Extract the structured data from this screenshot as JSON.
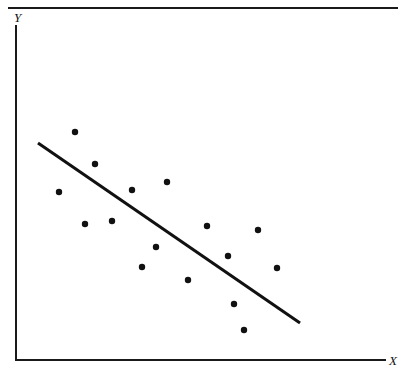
{
  "figure": {
    "background_color": "#ffffff",
    "ink_color": "#1a1a1a",
    "width": 405,
    "height": 374,
    "top_rule": {
      "visible": true,
      "x1": 8,
      "x2": 398,
      "y": 8,
      "thickness": 2
    }
  },
  "labels": {
    "y_axis": "Y",
    "x_axis": "X"
  },
  "chart_data": {
    "type": "scatter",
    "title": "",
    "subtitle": "",
    "xlabel": "X",
    "ylabel": "Y",
    "grid": false,
    "legend": null,
    "axis_style": "open-L-shape-arrowless",
    "axes": {
      "x_axis_pixel": {
        "x1": 16,
        "x2": 385,
        "y": 360
      },
      "y_axis_pixel": {
        "x": 16,
        "y1": 26,
        "y2": 360
      },
      "x_tick_labels": [],
      "y_tick_labels": [],
      "xlim_pixel": [
        16,
        385
      ],
      "ylim_pixel": [
        360,
        26
      ]
    },
    "annotations": [
      {
        "kind": "trend-line",
        "description": "downward-sloping best-fit line",
        "x1": 38,
        "y1": 143,
        "x2": 300,
        "y2": 323,
        "thickness": 3
      }
    ],
    "marker": {
      "shape": "circle",
      "radius": 3.2,
      "color": "#111111"
    },
    "n_points": 16,
    "points_pixel": [
      {
        "x": 75,
        "y": 132
      },
      {
        "x": 95,
        "y": 164
      },
      {
        "x": 59,
        "y": 192
      },
      {
        "x": 132,
        "y": 190
      },
      {
        "x": 167,
        "y": 182
      },
      {
        "x": 85,
        "y": 224
      },
      {
        "x": 112,
        "y": 221
      },
      {
        "x": 207,
        "y": 226
      },
      {
        "x": 258,
        "y": 230
      },
      {
        "x": 156,
        "y": 247
      },
      {
        "x": 228,
        "y": 256
      },
      {
        "x": 142,
        "y": 267
      },
      {
        "x": 277,
        "y": 268
      },
      {
        "x": 188,
        "y": 280
      },
      {
        "x": 234,
        "y": 304
      },
      {
        "x": 244,
        "y": 330
      }
    ],
    "x": [
      0.16,
      0.214,
      0.117,
      0.314,
      0.409,
      0.187,
      0.26,
      0.518,
      0.656,
      0.379,
      0.575,
      0.341,
      0.707,
      0.466,
      0.591,
      0.618
    ],
    "y": [
      0.683,
      0.587,
      0.503,
      0.509,
      0.533,
      0.407,
      0.416,
      0.401,
      0.389,
      0.338,
      0.311,
      0.278,
      0.275,
      0.24,
      0.168,
      0.09
    ],
    "relationship": "negative linear correlation"
  }
}
